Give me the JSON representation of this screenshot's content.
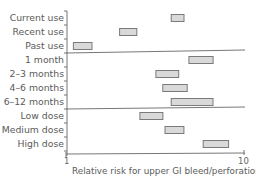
{
  "chart_data": {
    "type": "bar",
    "subtype": "horizontal-range (forest-style interval bars)",
    "title": "",
    "xlabel": "Relative risk for upper GI bleed/perforation",
    "ylabel": "",
    "xscale": "log",
    "xlim": [
      1,
      10
    ],
    "xticks": [
      "1",
      "10"
    ],
    "grid": false,
    "legend": null,
    "groups": [
      {
        "name": "Use timing",
        "categories": [
          "Current use",
          "Recent use",
          "Past use"
        ]
      },
      {
        "name": "Duration",
        "categories": [
          "1 month",
          "2–3 months",
          "4–6 months",
          "6–12 months"
        ]
      },
      {
        "name": "Dose",
        "categories": [
          "Low dose",
          "Medium dose",
          "High dose"
        ]
      }
    ],
    "categories": [
      "Current use",
      "Recent use",
      "Past use",
      "1 month",
      "2–3 months",
      "4–6 months",
      "6–12 months",
      "Low dose",
      "Medium dose",
      "High dose"
    ],
    "series": [
      {
        "name": "lower",
        "values": [
          3.9,
          2.0,
          1.1,
          4.9,
          3.2,
          3.5,
          3.9,
          2.6,
          3.6,
          5.9
        ]
      },
      {
        "name": "upper",
        "values": [
          4.6,
          2.5,
          1.4,
          6.7,
          4.3,
          4.8,
          6.7,
          3.5,
          4.6,
          8.2
        ]
      }
    ],
    "colors": {
      "bar_fill": "#d9d9d9",
      "bar_stroke": "#7a7a7a",
      "axis": "#777777"
    }
  },
  "labels": {
    "rows": [
      "Current use",
      "Recent use",
      "Past use",
      "1 month",
      "2–3 months",
      "4–6 months",
      "6–12 months",
      "Low dose",
      "Medium dose",
      "High dose"
    ],
    "tick_min": "1",
    "tick_max": "10",
    "xlabel": "Relative risk for upper GI bleed/perforation"
  }
}
